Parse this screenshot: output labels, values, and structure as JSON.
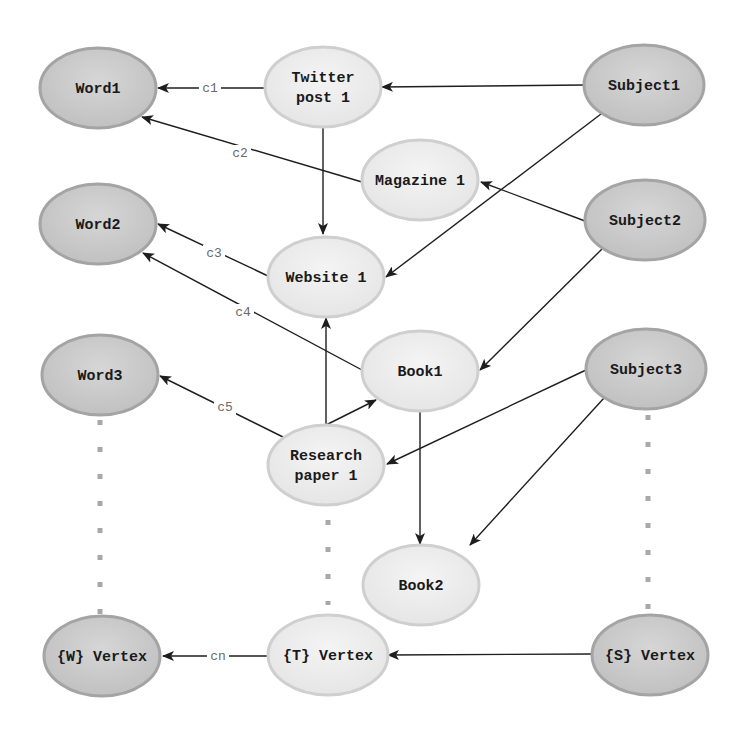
{
  "diagram": {
    "title": "",
    "colors": {
      "dark_node_fill": "#c8c8c8",
      "dark_node_stroke": "#a4a4a4",
      "light_node_fill": "#ececec",
      "light_node_stroke": "#cfcfcf",
      "edge": "#1e1e1e",
      "label": "#6a6a6a",
      "dots": "#a8a8a8"
    },
    "nodes": [
      {
        "id": "word1",
        "lines": [
          "Word1"
        ],
        "cx": 98,
        "cy": 88,
        "rx": 58,
        "ry": 40,
        "style": "dark"
      },
      {
        "id": "word2",
        "lines": [
          "Word2"
        ],
        "cx": 98,
        "cy": 224,
        "rx": 58,
        "ry": 40,
        "style": "dark"
      },
      {
        "id": "word3",
        "lines": [
          "Word3"
        ],
        "cx": 100,
        "cy": 375,
        "rx": 58,
        "ry": 40,
        "style": "dark"
      },
      {
        "id": "w_vertex",
        "lines": [
          "{W} Vertex"
        ],
        "cx": 102,
        "cy": 735,
        "rx": 60,
        "ry": 60,
        "style": "dark",
        "screen_cy": 736
      },
      {
        "id": "twitter_post_1",
        "lines": [
          "Twitter",
          "post 1"
        ],
        "cx": 323,
        "cy": 87,
        "rx": 58,
        "ry": 40,
        "style": "light"
      },
      {
        "id": "magazine_1",
        "lines": [
          "Magazine 1"
        ],
        "cx": 420,
        "cy": 180,
        "rx": 58,
        "ry": 40,
        "style": "light"
      },
      {
        "id": "website_1",
        "lines": [
          "Website 1"
        ],
        "cx": 326,
        "cy": 277,
        "rx": 58,
        "ry": 40,
        "style": "light"
      },
      {
        "id": "book1",
        "lines": [
          "Book1"
        ],
        "cx": 420,
        "cy": 371,
        "rx": 58,
        "ry": 40,
        "style": "light"
      },
      {
        "id": "research_paper_1",
        "lines": [
          "Research",
          "paper 1"
        ],
        "cx": 326,
        "cy": 465,
        "rx": 58,
        "ry": 40,
        "style": "light"
      },
      {
        "id": "book2",
        "lines": [
          "Book2"
        ],
        "cx": 421,
        "cy": 585,
        "rx": 58,
        "ry": 40,
        "style": "light"
      },
      {
        "id": "t_vertex",
        "lines": [
          "{T} Vertex"
        ],
        "cx": 328,
        "cy": 655,
        "rx": 60,
        "ry": 40,
        "style": "light"
      },
      {
        "id": "subject1",
        "lines": [
          "Subject1"
        ],
        "cx": 644,
        "cy": 85,
        "rx": 60,
        "ry": 40,
        "style": "dark"
      },
      {
        "id": "subject2",
        "lines": [
          "Subject2"
        ],
        "cx": 645,
        "cy": 220,
        "rx": 60,
        "ry": 40,
        "style": "dark"
      },
      {
        "id": "subject3",
        "lines": [
          "Subject3"
        ],
        "cx": 646,
        "cy": 369,
        "rx": 60,
        "ry": 40,
        "style": "dark"
      },
      {
        "id": "s_vertex",
        "lines": [
          "{S} Vertex"
        ],
        "cx": 650,
        "cy": 655,
        "rx": 58,
        "ry": 40,
        "style": "dark"
      }
    ],
    "edges": [
      {
        "from": "twitter_post_1",
        "to": "word1",
        "label": "c1",
        "x1": 265,
        "y1": 88,
        "x2": 158,
        "y2": 88,
        "lx": 210,
        "ly": 88
      },
      {
        "from": "magazine_1",
        "to": "word1",
        "label": "c2",
        "x1": 362,
        "y1": 182,
        "x2": 142,
        "y2": 117,
        "lx": 240,
        "ly": 153
      },
      {
        "from": "website_1",
        "to": "word2",
        "label": "c3",
        "x1": 268,
        "y1": 276,
        "x2": 158,
        "y2": 224,
        "lx": 214,
        "ly": 253
      },
      {
        "from": "book1",
        "to": "word2",
        "label": "c4",
        "x1": 362,
        "y1": 370,
        "x2": 143,
        "y2": 253,
        "lx": 243,
        "ly": 312
      },
      {
        "from": "research_paper_1",
        "to": "word3",
        "label": "c5",
        "x1": 285,
        "y1": 438,
        "x2": 160,
        "y2": 376,
        "lx": 225,
        "ly": 407
      },
      {
        "from": "t_vertex",
        "to": "w_vertex",
        "label": "cn",
        "x1": 268,
        "y1": 656,
        "x2": 163,
        "y2": 656,
        "lx": 218,
        "ly": 656
      },
      {
        "from": "subject1",
        "to": "twitter_post_1",
        "label": "",
        "x1": 584,
        "y1": 85,
        "x2": 382,
        "y2": 87
      },
      {
        "from": "subject1",
        "to": "website_1",
        "label": "",
        "x1": 601,
        "y1": 114,
        "x2": 386,
        "y2": 277
      },
      {
        "from": "subject2",
        "to": "magazine_1",
        "label": "",
        "x1": 585,
        "y1": 221,
        "x2": 481,
        "y2": 182
      },
      {
        "from": "subject2",
        "to": "book1",
        "label": "",
        "x1": 602,
        "y1": 249,
        "x2": 480,
        "y2": 370
      },
      {
        "from": "subject3",
        "to": "research_paper_1",
        "label": "",
        "x1": 586,
        "y1": 370,
        "x2": 387,
        "y2": 464
      },
      {
        "from": "subject3",
        "to": "book2",
        "label": "",
        "x1": 604,
        "y1": 398,
        "x2": 470,
        "y2": 545
      },
      {
        "from": "twitter_post_1",
        "to": "website_1",
        "label": "",
        "x1": 323,
        "y1": 128,
        "x2": 323,
        "y2": 234
      },
      {
        "from": "research_paper_1",
        "to": "website_1",
        "label": "",
        "x1": 326,
        "y1": 425,
        "x2": 326,
        "y2": 318
      },
      {
        "from": "research_paper_1",
        "to": "book1",
        "label": "",
        "x1": 326,
        "y1": 425,
        "x2": 376,
        "y2": 400
      },
      {
        "from": "book1",
        "to": "book2",
        "label": "",
        "x1": 420,
        "y1": 411,
        "x2": 420,
        "y2": 544
      },
      {
        "from": "s_vertex",
        "to": "t_vertex",
        "label": "",
        "x1": 591,
        "y1": 654,
        "x2": 388,
        "y2": 655
      }
    ],
    "ellipsis_columns": [
      {
        "id": "words-ellipsis",
        "x": 100,
        "y1": 420,
        "y2": 615
      },
      {
        "id": "texts-ellipsis",
        "x": 328,
        "y1": 520,
        "y2": 605
      },
      {
        "id": "subjects-ellipsis",
        "x": 648,
        "y1": 415,
        "y2": 612
      }
    ]
  }
}
